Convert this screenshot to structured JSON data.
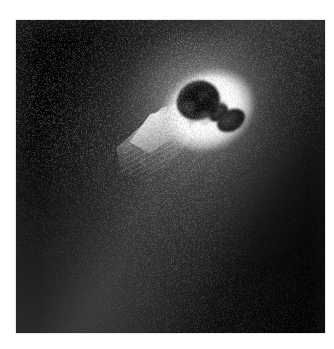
{
  "page": {
    "background_color": "#ffffff",
    "width": 334,
    "height": 349
  },
  "figure": {
    "name": "comet-nucleus-image",
    "kind": "grayscale-astronomical-photograph",
    "caption": "",
    "panel": {
      "x": 16,
      "y": 20,
      "width": 309,
      "height": 313,
      "background_color": "#030303",
      "border_color": "#e8e8e8"
    },
    "palette": {
      "background": "#030303",
      "nucleus_dark": "#1d1d1d",
      "nucleus_mid": "#3c3c3c",
      "halo_bright": "#ffffff",
      "jet_bright": "#ececec",
      "coma_mid": "#7d7d7d",
      "coma_faint": "#3e3e3e",
      "margin": "#ffffff"
    },
    "features": [
      {
        "name": "nucleus",
        "description": "dark peanut / dumbbell shaped solid body",
        "center_x": 192,
        "center_y": 86,
        "label": ""
      },
      {
        "name": "nucleus-halo",
        "description": "bright white rim of scattered light surrounding the nucleus",
        "center_x": 192,
        "center_y": 90,
        "label": ""
      },
      {
        "name": "dust-jet",
        "description": "bright triangular fan of dust emitted toward lower-left",
        "center_x": 150,
        "center_y": 118,
        "label": ""
      },
      {
        "name": "coma-band",
        "description": "diffuse grainy coma extending diagonally from upper-right to lower-left",
        "center_x": 160,
        "center_y": 180,
        "label": ""
      },
      {
        "name": "outer-coma",
        "description": "broad faint halo of dust around the nucleus",
        "center_x": 170,
        "center_y": 95,
        "label": ""
      }
    ]
  },
  "chart_data": {
    "type": "heatmap",
    "title": "",
    "xlabel": "",
    "ylabel": "",
    "colormap": "grayscale",
    "value_range": [
      0,
      255
    ],
    "regions": [
      {
        "label": "panel background",
        "x": 40,
        "y": 290,
        "brightness": 4
      },
      {
        "label": "outer coma edge",
        "x": 70,
        "y": 230,
        "brightness": 26
      },
      {
        "label": "coma band core",
        "x": 110,
        "y": 180,
        "brightness": 58
      },
      {
        "label": "inner coma",
        "x": 150,
        "y": 120,
        "brightness": 112
      },
      {
        "label": "dust jet fan",
        "x": 140,
        "y": 108,
        "brightness": 198
      },
      {
        "label": "halo ring",
        "x": 172,
        "y": 64,
        "brightness": 248
      },
      {
        "label": "nucleus major lobe",
        "x": 180,
        "y": 80,
        "brightness": 34
      },
      {
        "label": "nucleus minor lobe",
        "x": 214,
        "y": 100,
        "brightness": 22
      },
      {
        "label": "upper halo arc",
        "x": 195,
        "y": 34,
        "brightness": 46
      },
      {
        "label": "right field",
        "x": 290,
        "y": 200,
        "brightness": 6
      }
    ]
  }
}
